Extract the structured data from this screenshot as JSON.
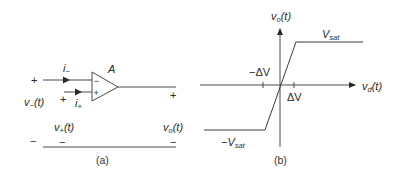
{
  "figure": {
    "panel_a": {
      "caption": "(a)",
      "amplifier_gain_label": "A",
      "inverting_input_sign": "−",
      "noninverting_input_sign": "+",
      "current_minus": {
        "base": "i",
        "sub": "−"
      },
      "current_plus": {
        "base": "i",
        "sub": "+"
      },
      "v_minus": {
        "base": "v",
        "sub": "−",
        "arg": "(t)"
      },
      "v_plus": {
        "base": "v",
        "sub": "+",
        "arg": "(t)"
      },
      "v_out": {
        "base": "v",
        "sub": "o",
        "arg": "(t)"
      },
      "plus_sign": "+",
      "minus_sign": "−"
    },
    "panel_b": {
      "caption": "(b)",
      "y_axis": {
        "base": "v",
        "sub": "o",
        "arg": "(t)"
      },
      "x_axis": {
        "base": "v",
        "sub": "d",
        "arg": "(t)"
      },
      "v_sat": {
        "base": "V",
        "sub": "sat"
      },
      "neg_v_sat": {
        "prefix": "−",
        "base": "V",
        "sub": "sat"
      },
      "delta_v": "ΔV",
      "neg_delta_v": "−ΔV"
    },
    "colors": {
      "line": "#4a4a4a",
      "text": "#2a2a2a",
      "background": "#ffffff"
    }
  }
}
